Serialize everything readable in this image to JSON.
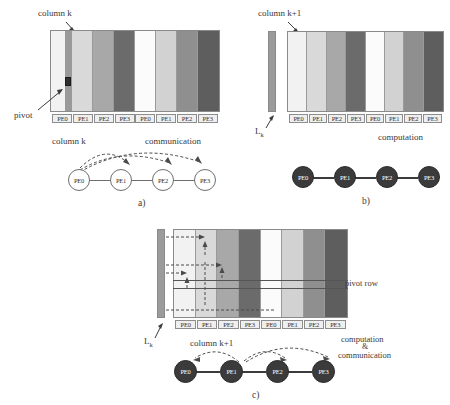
{
  "figure": {
    "caption_a": "a)",
    "caption_b": "b)",
    "caption_c": "c)",
    "processor_labels": [
      "PE0",
      "PE1",
      "PE2",
      "PE3",
      "PE0",
      "PE1",
      "PE2",
      "PE3"
    ],
    "node_labels": [
      "PE0",
      "PE1",
      "PE2",
      "PE3"
    ]
  },
  "palette": {
    "shade_very_light": "#f2f2f2",
    "shade_light": "#d9d9d9",
    "shade_medium": "#a8a8a8",
    "shade_dark": "#6b6b6b",
    "shade_white": "#fbfbfb",
    "shade_light2": "#d2d2d2",
    "shade_medium2": "#8f8f8f",
    "shade_dark2": "#5e5e5e",
    "lk_strip": "#9b9b9b",
    "node_fill_open": "#ffffff",
    "node_fill_solid": "#3b3b3b",
    "pivot_cell": "#2e2e2e",
    "arrow_dashed": "#4a4a4a",
    "outline": "#8a8a8a"
  },
  "panel_a": {
    "label_column_k": "column k",
    "label_pivot": "pivot",
    "label_column_k_graph": "column k",
    "label_communication": "communication",
    "caption": "a)",
    "column_shades": [
      "#f2f2f2",
      "#d9d9d9",
      "#a8a8a8",
      "#6b6b6b",
      "#fbfbfb",
      "#d2d2d2",
      "#8f8f8f",
      "#5e5e5e"
    ],
    "pe_tags": [
      "PE0",
      "PE1",
      "PE2",
      "PE3",
      "PE0",
      "PE1",
      "PE2",
      "PE3"
    ],
    "nodes": [
      "PE0",
      "PE1",
      "PE2",
      "PE3"
    ],
    "broadcast_from": "PE0",
    "broadcast_to": [
      "PE1",
      "PE2",
      "PE3"
    ]
  },
  "panel_b": {
    "label_column_k1": "column k+1",
    "label_lk": "L",
    "label_lk_sub": "k",
    "label_computation": "computation",
    "caption": "b)",
    "column_shades": [
      "#f2f2f2",
      "#d9d9d9",
      "#a8a8a8",
      "#6b6b6b",
      "#fbfbfb",
      "#d2d2d2",
      "#8f8f8f",
      "#5e5e5e"
    ],
    "pe_tags": [
      "PE0",
      "PE1",
      "PE2",
      "PE3",
      "PE0",
      "PE1",
      "PE2",
      "PE3"
    ],
    "nodes": [
      "PE0",
      "PE1",
      "PE2",
      "PE3"
    ]
  },
  "panel_c": {
    "label_lk": "L",
    "label_lk_sub": "k",
    "label_pivot_row": "pivot row",
    "label_column_k1": "column k+1",
    "label_computation": "computation",
    "label_amp": "&",
    "label_communication": "communication",
    "caption": "c)",
    "column_shades": [
      "#f2f2f2",
      "#d9d9d9",
      "#a8a8a8",
      "#6b6b6b",
      "#fbfbfb",
      "#d2d2d2",
      "#8f8f8f",
      "#5e5e5e"
    ],
    "pe_tags": [
      "PE0",
      "PE1",
      "PE2",
      "PE3",
      "PE0",
      "PE1",
      "PE2",
      "PE3"
    ],
    "nodes": [
      "PE0",
      "PE1",
      "PE2",
      "PE3"
    ],
    "broadcast_from": "PE1",
    "broadcast_to": [
      "PE0",
      "PE2",
      "PE3"
    ]
  }
}
